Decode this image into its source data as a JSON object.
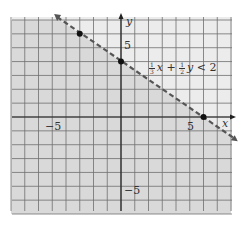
{
  "chart_data": {
    "type": "line",
    "title": "",
    "inequality": "1/3 x + 1/2 y < 2",
    "boundary_line": {
      "equation": "1/3 x + 1/2 y = 2",
      "slope": -0.6667,
      "y_intercept": 4,
      "style": "dashed"
    },
    "shaded_region": "below line",
    "points": [
      {
        "x": -3,
        "y": 6
      },
      {
        "x": 0,
        "y": 4
      },
      {
        "x": 6,
        "y": 0
      }
    ],
    "xlabel": "x",
    "ylabel": "y",
    "xlim": [
      -8,
      8
    ],
    "ylim": [
      -7,
      7
    ],
    "x_tick_labels": [
      "-5",
      "5"
    ],
    "y_tick_labels": [
      "5",
      "-5"
    ],
    "grid": true
  },
  "labels": {
    "x_axis": "x",
    "y_axis": "y",
    "x_neg5": "−5",
    "x_pos5": "5",
    "y_pos5": "5",
    "y_neg5": "−5",
    "ineq_frac1_num": "1",
    "ineq_frac1_den": "3",
    "ineq_x": "x",
    "ineq_plus": " + ",
    "ineq_frac2_num": "1",
    "ineq_frac2_den": "2",
    "ineq_y": "y",
    "ineq_rest": " < 2"
  },
  "colors": {
    "shade": "#d9d9d9",
    "unshaded": "#ececec",
    "grid": "#6e6e6e",
    "axis": "#222222",
    "line": "#555555",
    "point": "#111111"
  }
}
